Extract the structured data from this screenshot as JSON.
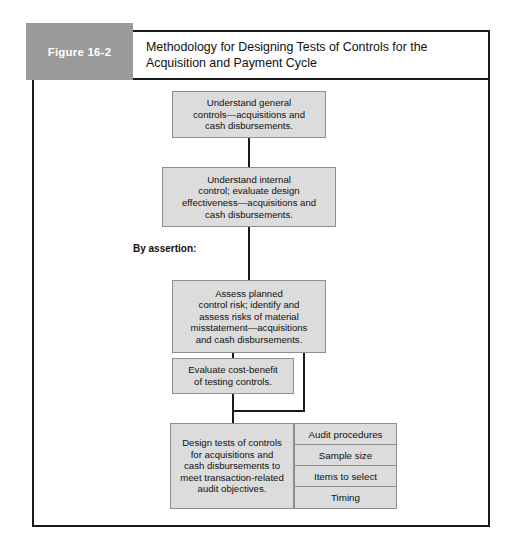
{
  "figure": {
    "number_label": "Figure 16-2",
    "title_line1": "Methodology for Designing Tests of Controls for the",
    "title_line2": "Acquisition and Payment Cycle",
    "accent_gray": "#9a9a9a",
    "box_fill": "#dcdcdc",
    "box_border": "#8e8e8e",
    "line_color": "#1a1a1a"
  },
  "flow": {
    "assertion_label": "By assertion:",
    "steps": [
      {
        "id": "understand-general-controls",
        "lines": [
          "Understand general",
          "controls—acquisitions and",
          "cash disbursements."
        ]
      },
      {
        "id": "understand-internal-control",
        "lines": [
          "Understand internal",
          "control; evaluate design",
          "effectiveness—acquisitions and",
          "cash disbursements."
        ]
      },
      {
        "id": "assess-planned-control-risk",
        "lines": [
          "Assess planned",
          "control risk; identify and",
          "assess risks of material",
          "misstatement—acquisitions",
          "and cash disbursements."
        ]
      },
      {
        "id": "evaluate-cost-benefit",
        "lines": [
          "Evaluate cost-benefit",
          "of testing controls."
        ]
      },
      {
        "id": "design-tests-of-controls",
        "lines": [
          "Design tests of controls",
          "for acquisitions and",
          "cash disbursements to",
          "meet transaction-related",
          "audit objectives."
        ]
      }
    ],
    "design_elements": [
      {
        "id": "audit-procedures",
        "label": "Audit procedures"
      },
      {
        "id": "sample-size",
        "label": "Sample size"
      },
      {
        "id": "items-to-select",
        "label": "Items to select"
      },
      {
        "id": "timing",
        "label": "Timing"
      }
    ]
  }
}
